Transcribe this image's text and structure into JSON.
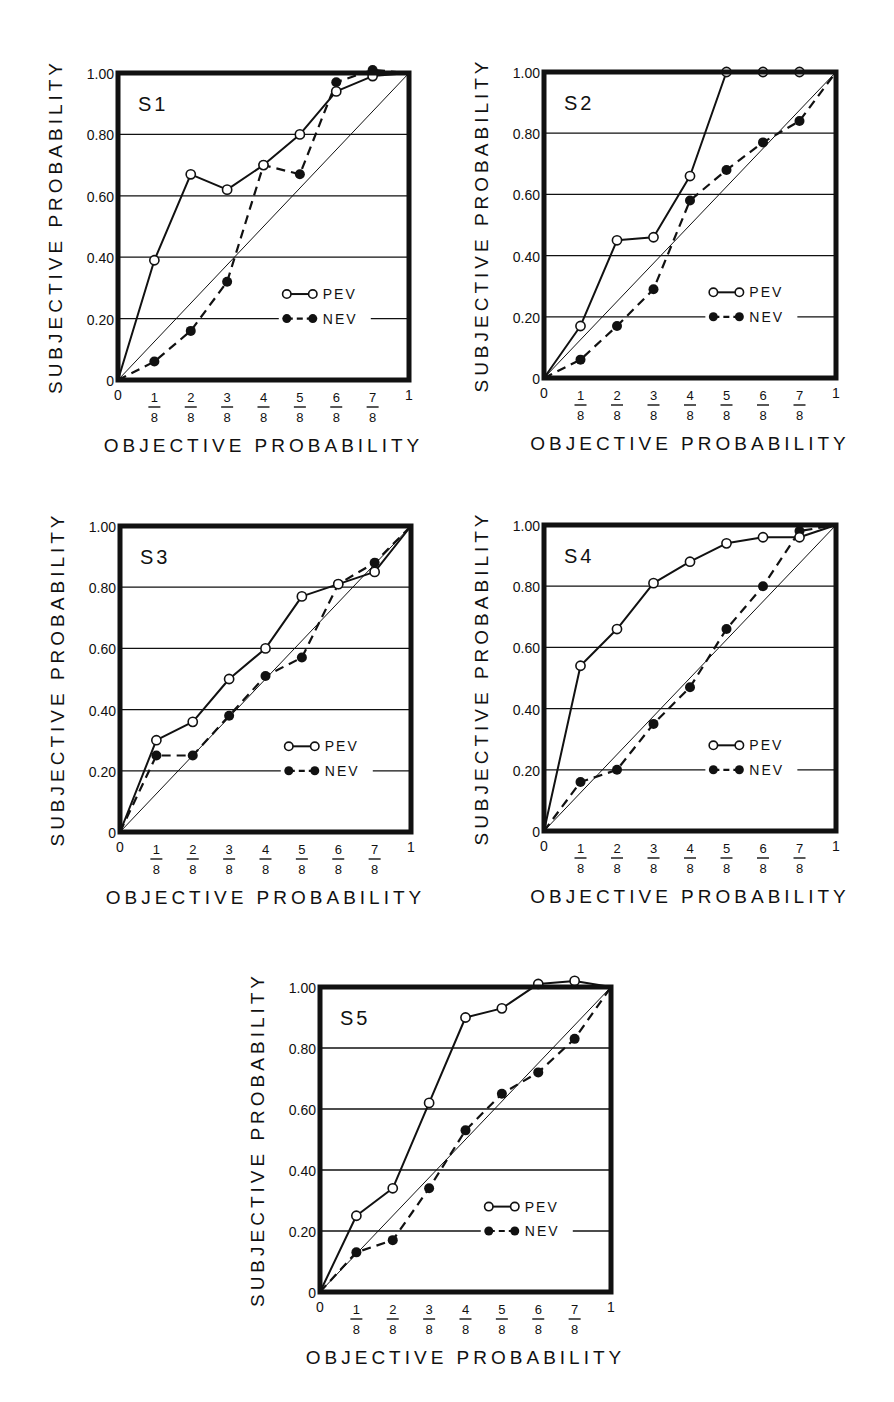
{
  "figure": {
    "xlabel": "OBJECTIVE PROBABILITY",
    "ylabel": "SUBJECTIVE PROBABILITY",
    "x_tick_labels": [
      "0",
      "1/8",
      "2/8",
      "3/8",
      "4/8",
      "5/8",
      "6/8",
      "7/8",
      "1"
    ],
    "y_tick_labels": [
      "0",
      "0.20",
      "0.40",
      "0.60",
      "0.80",
      "1.00"
    ],
    "legend": [
      {
        "label": "PEV",
        "marker": "open-circle",
        "line": "solid"
      },
      {
        "label": "NEV",
        "marker": "filled-circle",
        "line": "dashed"
      }
    ]
  },
  "chart_data": [
    {
      "type": "line",
      "title": "S1",
      "xlabel": "OBJECTIVE PROBABILITY",
      "ylabel": "SUBJECTIVE PROBABILITY",
      "x": [
        0,
        0.125,
        0.25,
        0.375,
        0.5,
        0.625,
        0.75,
        0.875,
        1
      ],
      "x_tick_labels": [
        "0",
        "1/8",
        "2/8",
        "3/8",
        "4/8",
        "5/8",
        "6/8",
        "7/8",
        "1"
      ],
      "xlim": [
        0,
        1
      ],
      "ylim": [
        0,
        1
      ],
      "grid": "horizontal at 0.20, 0.40, 0.60, 0.80",
      "reference_line": "diagonal y = x",
      "legend_position": "lower right",
      "series": [
        {
          "name": "PEV",
          "style": "solid, open circles",
          "values": [
            0,
            0.39,
            0.67,
            0.62,
            0.7,
            0.8,
            0.94,
            0.99,
            1.0
          ]
        },
        {
          "name": "NEV",
          "style": "dashed, filled circles",
          "values": [
            0,
            0.06,
            0.16,
            0.32,
            0.7,
            0.67,
            0.97,
            1.01,
            1.0
          ]
        }
      ]
    },
    {
      "type": "line",
      "title": "S2",
      "xlabel": "OBJECTIVE PROBABILITY",
      "ylabel": "SUBJECTIVE PROBABILITY",
      "x": [
        0,
        0.125,
        0.25,
        0.375,
        0.5,
        0.625,
        0.75,
        0.875,
        1
      ],
      "x_tick_labels": [
        "0",
        "1/8",
        "2/8",
        "3/8",
        "4/8",
        "5/8",
        "6/8",
        "7/8",
        "1"
      ],
      "xlim": [
        0,
        1
      ],
      "ylim": [
        0,
        1
      ],
      "grid": "horizontal at 0.20, 0.40, 0.60, 0.80",
      "reference_line": "diagonal y = x",
      "legend_position": "lower right",
      "series": [
        {
          "name": "PEV",
          "style": "solid, open circles",
          "values": [
            0,
            0.17,
            0.45,
            0.46,
            0.66,
            1.0,
            1.0,
            1.0,
            1.0
          ]
        },
        {
          "name": "NEV",
          "style": "dashed, filled circles",
          "values": [
            0,
            0.06,
            0.17,
            0.29,
            0.58,
            0.68,
            0.77,
            0.84,
            1.0
          ]
        }
      ]
    },
    {
      "type": "line",
      "title": "S3",
      "xlabel": "OBJECTIVE PROBABILITY",
      "ylabel": "SUBJECTIVE PROBABILITY",
      "x": [
        0,
        0.125,
        0.25,
        0.375,
        0.5,
        0.625,
        0.75,
        0.875,
        1
      ],
      "x_tick_labels": [
        "0",
        "1/8",
        "2/8",
        "3/8",
        "4/8",
        "5/8",
        "6/8",
        "7/8",
        "1"
      ],
      "xlim": [
        0,
        1
      ],
      "ylim": [
        0,
        1
      ],
      "grid": "horizontal at 0.20, 0.40, 0.60, 0.80",
      "reference_line": "diagonal y = x",
      "legend_position": "lower right",
      "series": [
        {
          "name": "PEV",
          "style": "solid, open circles",
          "values": [
            0,
            0.3,
            0.36,
            0.5,
            0.6,
            0.77,
            0.81,
            0.85,
            1.0
          ]
        },
        {
          "name": "NEV",
          "style": "dashed, filled circles",
          "values": [
            0,
            0.25,
            0.25,
            0.38,
            0.51,
            0.57,
            0.81,
            0.88,
            1.0
          ]
        }
      ]
    },
    {
      "type": "line",
      "title": "S4",
      "xlabel": "OBJECTIVE PROBABILITY",
      "ylabel": "SUBJECTIVE PROBABILITY",
      "x": [
        0,
        0.125,
        0.25,
        0.375,
        0.5,
        0.625,
        0.75,
        0.875,
        1
      ],
      "x_tick_labels": [
        "0",
        "1/8",
        "2/8",
        "3/8",
        "4/8",
        "5/8",
        "6/8",
        "7/8",
        "1"
      ],
      "xlim": [
        0,
        1
      ],
      "ylim": [
        0,
        1
      ],
      "grid": "horizontal at 0.20, 0.40, 0.60, 0.80",
      "reference_line": "diagonal y = x",
      "legend_position": "lower right",
      "series": [
        {
          "name": "PEV",
          "style": "solid, open circles",
          "values": [
            0,
            0.54,
            0.66,
            0.81,
            0.88,
            0.94,
            0.96,
            0.96,
            1.0
          ]
        },
        {
          "name": "NEV",
          "style": "dashed, filled circles",
          "values": [
            0,
            0.16,
            0.2,
            0.35,
            0.47,
            0.66,
            0.8,
            0.98,
            1.0
          ]
        }
      ]
    },
    {
      "type": "line",
      "title": "S5",
      "xlabel": "OBJECTIVE PROBABILITY",
      "ylabel": "SUBJECTIVE PROBABILITY",
      "x": [
        0,
        0.125,
        0.25,
        0.375,
        0.5,
        0.625,
        0.75,
        0.875,
        1
      ],
      "x_tick_labels": [
        "0",
        "1/8",
        "2/8",
        "3/8",
        "4/8",
        "5/8",
        "6/8",
        "7/8",
        "1"
      ],
      "xlim": [
        0,
        1
      ],
      "ylim": [
        0,
        1
      ],
      "grid": "horizontal at 0.20, 0.40, 0.60, 0.80",
      "reference_line": "diagonal y = x",
      "legend_position": "lower right",
      "series": [
        {
          "name": "PEV",
          "style": "solid, open circles",
          "values": [
            0,
            0.25,
            0.34,
            0.62,
            0.9,
            0.93,
            1.01,
            1.02,
            1.0
          ]
        },
        {
          "name": "NEV",
          "style": "dashed, filled circles",
          "values": [
            0,
            0.13,
            0.17,
            0.34,
            0.53,
            0.65,
            0.72,
            0.83,
            1.0
          ]
        }
      ]
    }
  ],
  "layout": {
    "panels": [
      {
        "left": 118,
        "top": 73,
        "width": 291,
        "height": 307
      },
      {
        "left": 544,
        "top": 72,
        "width": 292,
        "height": 306
      },
      {
        "left": 120,
        "top": 526,
        "width": 291,
        "height": 306
      },
      {
        "left": 544,
        "top": 525,
        "width": 292,
        "height": 306
      },
      {
        "left": 320,
        "top": 987,
        "width": 291,
        "height": 305
      }
    ]
  }
}
